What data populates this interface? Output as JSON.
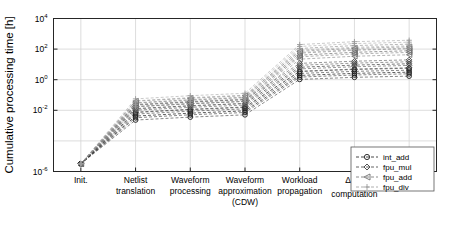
{
  "chart_data": {
    "type": "line",
    "title": "",
    "xlabel": "",
    "ylabel": "Cumulative processing time [h]",
    "yscale": "log",
    "ylim": [
      1e-06,
      10000.0
    ],
    "ytick_labels": [
      "10-6",
      "10-2",
      "100",
      "102",
      "104"
    ],
    "ytick_bases": [
      "10",
      "10",
      "10",
      "10",
      "10"
    ],
    "ytick_exponents": [
      "-6",
      "-2",
      "0",
      "2",
      "4"
    ],
    "ytick_values": [
      1e-06,
      0.01,
      1,
      100,
      10000
    ],
    "grid": true,
    "legend_position": "lower right",
    "categories": [
      "Init.",
      "Netlist translation",
      "Waveform processing",
      "Waveform approximation (CDW)",
      "Workload propagation",
      "Δ Vth computation",
      "STA"
    ],
    "categories_lines": [
      [
        "Init."
      ],
      [
        "Netlist",
        "translation"
      ],
      [
        "Waveform",
        "processing"
      ],
      [
        "Waveform",
        "approximation",
        "(CDW)"
      ],
      [
        "Workload",
        "propagation"
      ],
      [
        "Δ Vth",
        "computation"
      ],
      [
        "STA"
      ]
    ],
    "series": [
      {
        "name": "int_add",
        "marker": "circle",
        "color": "#1a1a1a",
        "values": [
          3.2e-06,
          0.0042,
          0.0065,
          0.0092,
          1.9,
          2.6,
          3.1
        ]
      },
      {
        "name": "fpu_mul",
        "marker": "diamond",
        "color": "#3c3c3c",
        "values": [
          3.2e-06,
          0.013,
          0.02,
          0.028,
          6.5,
          9.0,
          11.0
        ]
      },
      {
        "name": "fpu_add",
        "marker": "left-triangle",
        "color": "#6e6e6e",
        "values": [
          3.2e-06,
          0.022,
          0.034,
          0.05,
          40.0,
          62.0,
          78.0
        ]
      },
      {
        "name": "fpu_div",
        "marker": "plus",
        "color": "#9a9a9a",
        "values": [
          3.2e-06,
          0.031,
          0.05,
          0.072,
          110.0,
          170.0,
          210.0
        ]
      }
    ],
    "legend_entries": [
      {
        "label": "int_add",
        "marker": "circle"
      },
      {
        "label": "fpu_mul",
        "marker": "diamond"
      },
      {
        "label": "fpu_add",
        "marker": "left-triangle"
      },
      {
        "label": "fpu_div",
        "marker": "plus"
      }
    ]
  }
}
